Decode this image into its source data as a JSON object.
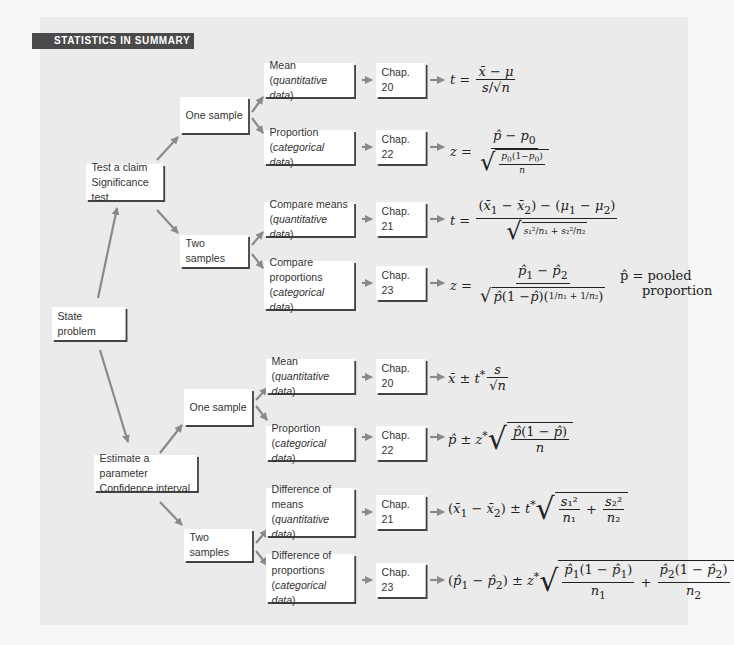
{
  "header": {
    "title": "STATISTICS IN SUMMARY"
  },
  "root": {
    "label": "State problem"
  },
  "significance": {
    "line1": "Test a claim",
    "line2": "Significance test",
    "one_sample": {
      "label": "One sample",
      "mean": {
        "line1": "Mean",
        "line2": "quantitative data",
        "chapter": "Chap. 20",
        "formula": "t = (x̄ − μ) / (s/√n)"
      },
      "proportion": {
        "line1": "Proportion",
        "line2": "categorical data",
        "chapter": "Chap. 22",
        "formula": "z = (p̂ − p0) / √(p0(1−p0)/n)"
      }
    },
    "two_samples": {
      "label": "Two samples",
      "means": {
        "line1": "Compare means",
        "line2": "quantitative data",
        "chapter": "Chap. 21",
        "formula": "t = ((x̄1 − x̄2) − (μ1 − μ2)) / √(s1²/n1 + s2²/n2)"
      },
      "proportions": {
        "line1": "Compare",
        "line2": "proportions",
        "line3": "categorical data",
        "chapter": "Chap. 23",
        "formula": "z = (p̂1 − p̂2) / √(p̂(1−p̂)(1/n1 + 1/n2))",
        "note_line1": "p̂ = pooled",
        "note_line2": "proportion"
      }
    }
  },
  "confidence": {
    "line1": "Estimate a parameter",
    "line2": "Confidence interval",
    "one_sample": {
      "label": "One sample",
      "mean": {
        "line1": "Mean",
        "line2": "quantitative data",
        "chapter": "Chap. 20",
        "formula": "x̄ ± t* s/√n"
      },
      "proportion": {
        "line1": "Proportion",
        "line2": "categorical data",
        "chapter": "Chap. 22",
        "formula": "p̂ ± z* √(p̂(1−p̂)/n)"
      }
    },
    "two_samples": {
      "label": "Two samples",
      "means": {
        "line1": "Difference of",
        "line2": "means",
        "line3": "quantitative data",
        "chapter": "Chap. 21",
        "formula": "(x̄1 − x̄2) ± t* √(s1²/n1 + s2²/n2)"
      },
      "proportions": {
        "line1": "Difference of",
        "line2": "proportions",
        "line3": "categorical data",
        "chapter": "Chap. 23",
        "formula": "(p̂1 − p̂2) ± z* √(p̂1(1−p̂1)/n1 + p̂2(1−p̂2)/n2)"
      }
    }
  },
  "colors": {
    "panel": "#ebebeb",
    "header": "#4a4a4a",
    "arrow": "#8a8a8a",
    "box_shadow": "#444444"
  }
}
